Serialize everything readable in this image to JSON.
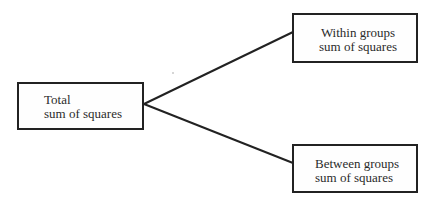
{
  "diagram": {
    "type": "tree",
    "root": {
      "id": "total",
      "line1": "Total",
      "line2": "sum of squares"
    },
    "children": [
      {
        "id": "within",
        "line1": "Within groups",
        "line2": "sum of squares"
      },
      {
        "id": "between",
        "line1": "Between groups",
        "line2": "sum of squares"
      }
    ],
    "colors": {
      "line": "#222222",
      "text": "#2b2b2b",
      "background": "#ffffff"
    }
  }
}
